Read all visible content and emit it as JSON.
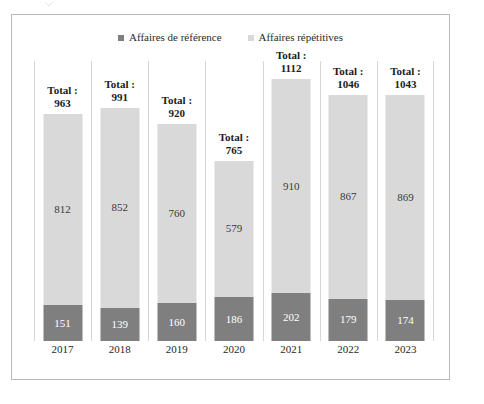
{
  "chart_data": {
    "type": "bar",
    "subtype": "stacked-column",
    "title": "",
    "xlabel": "",
    "ylabel": "",
    "grid": false,
    "legend_position": "top-center",
    "axis_visible": false,
    "categories": [
      "2017",
      "2018",
      "2019",
      "2020",
      "2021",
      "2022",
      "2023"
    ],
    "series": [
      {
        "name": "Affaires de référence",
        "color": "#7f7f7f",
        "stack_position": "bottom",
        "values": [
          151,
          139,
          160,
          186,
          202,
          179,
          174
        ]
      },
      {
        "name": "Affaires répétitives",
        "color": "#d9d9d9",
        "stack_position": "top",
        "values": [
          812,
          852,
          760,
          579,
          910,
          867,
          869
        ]
      }
    ],
    "totals": [
      963,
      991,
      920,
      765,
      1112,
      1046,
      1043
    ],
    "total_prefix": "Total :",
    "ymax": 1112
  },
  "legend": {
    "items": [
      {
        "label": "Affaires de référence",
        "color": "#7f7f7f",
        "marker": "square-marker"
      },
      {
        "label": "Affaires répétitives",
        "color": "#d9d9d9",
        "marker": "square-marker"
      }
    ]
  },
  "colors": {
    "reference_series": "#7f7f7f",
    "repetitive_series": "#d9d9d9",
    "frame_border": "#b9b9b9",
    "separator": "#d5d5d5",
    "text": "#1f1f1f"
  }
}
